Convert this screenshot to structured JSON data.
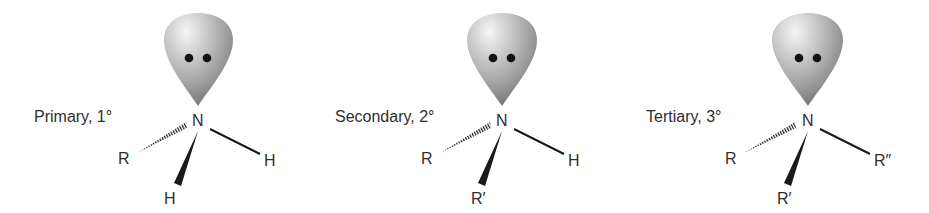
{
  "diagram": {
    "colors": {
      "text": "#2e2e2e",
      "bond": "#1a1a1a",
      "lobe_light": "#f4f4f4",
      "lobe_mid": "#a8a8a8",
      "lobe_dark": "#6a6a6a",
      "electron": "#111111"
    },
    "molecules": [
      {
        "class_label": "Primary, 1°",
        "center_atom": "N",
        "hashed_substituent": "R",
        "plain_substituent": "H",
        "wedge_substituent": "H",
        "lone_pair": "••"
      },
      {
        "class_label": "Secondary, 2°",
        "center_atom": "N",
        "hashed_substituent": "R",
        "plain_substituent": "H",
        "wedge_substituent": "R′",
        "lone_pair": "••"
      },
      {
        "class_label": "Tertiary, 3°",
        "center_atom": "N",
        "hashed_substituent": "R",
        "plain_substituent": "R″",
        "wedge_substituent": "R′",
        "lone_pair": "••"
      }
    ]
  }
}
